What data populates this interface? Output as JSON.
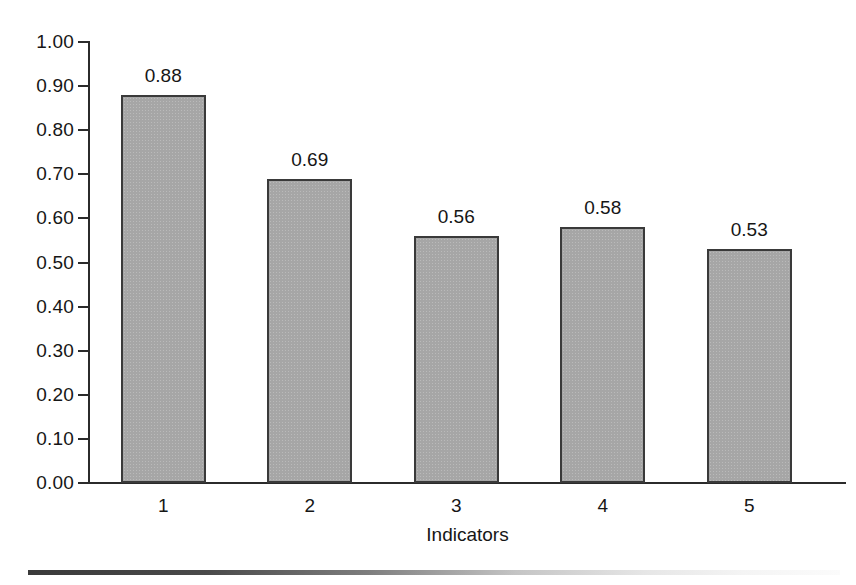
{
  "chart_data": {
    "type": "bar",
    "title": "",
    "subtitle": "",
    "xlabel": "Indicators",
    "ylabel": "",
    "categories": [
      "1",
      "2",
      "3",
      "4",
      "5"
    ],
    "values": [
      0.88,
      0.69,
      0.56,
      0.58,
      0.53
    ],
    "value_labels": [
      "0.88",
      "0.69",
      "0.56",
      "0.58",
      "0.53"
    ],
    "ylim": [
      0.0,
      1.0
    ],
    "ytick_values": [
      1.0,
      0.9,
      0.8,
      0.7,
      0.6,
      0.5,
      0.4,
      0.3,
      0.2,
      0.1,
      0.0
    ],
    "ytick_labels": [
      "1.00",
      "0.90",
      "0.80",
      "0.70",
      "0.60",
      "0.50",
      "0.40",
      "0.30",
      "0.20",
      "0.10",
      "0.00"
    ],
    "grid": false,
    "legend": null,
    "legend_position": "none",
    "bar_fill_color": "#a6a6a6",
    "bar_border_color": "#3a3a3a",
    "axis_color": "#2b2b2b",
    "text_color": "#161616",
    "background_color": "#ffffff",
    "data_labels_shown": true
  },
  "axis": {
    "x_tick_labels": [
      "1",
      "2",
      "3",
      "4",
      "5"
    ],
    "x_axis_title": "Indicators",
    "y_tick_labels": [
      "1.00",
      "0.90",
      "0.80",
      "0.70",
      "0.60",
      "0.50",
      "0.40",
      "0.30",
      "0.20",
      "0.10",
      "0.00"
    ]
  },
  "bars": [
    {
      "category": "1",
      "value": 0.88,
      "label": "0.88"
    },
    {
      "category": "2",
      "value": 0.69,
      "label": "0.69"
    },
    {
      "category": "3",
      "value": 0.56,
      "label": "0.56"
    },
    {
      "category": "4",
      "value": 0.58,
      "label": "0.58"
    },
    {
      "category": "5",
      "value": 0.53,
      "label": "0.53"
    }
  ]
}
